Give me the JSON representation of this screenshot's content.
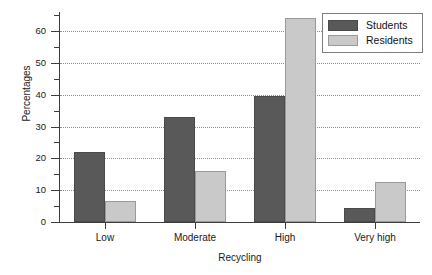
{
  "chart_data": {
    "type": "bar",
    "title": "",
    "xlabel": "Recycling",
    "ylabel": "Percentages",
    "categories": [
      "Low",
      "Moderate",
      "High",
      "Very high"
    ],
    "series": [
      {
        "name": "Students",
        "color": "#595959",
        "values": [
          22,
          33,
          39.5,
          4.5
        ]
      },
      {
        "name": "Residents",
        "color": "#c9c9c9",
        "values": [
          6.5,
          16,
          64,
          12.5
        ]
      }
    ],
    "ylim": [
      0,
      66
    ],
    "ytick_labels": [
      "0",
      "10",
      "20",
      "30",
      "40",
      "50",
      "60"
    ],
    "ytick_values": [
      0,
      10,
      20,
      30,
      40,
      50,
      60
    ],
    "yminor_step": 5,
    "grid": "horizontal-dotted",
    "legend_position": "top-right"
  },
  "legend": {
    "entries": [
      {
        "label": "Students"
      },
      {
        "label": "Residents"
      }
    ]
  }
}
